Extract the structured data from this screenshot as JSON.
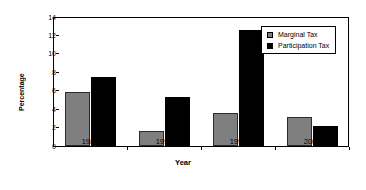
{
  "chart_data": {
    "type": "bar",
    "title": "",
    "xlabel": "Year",
    "ylabel": "Percentage",
    "categories": [
      "1986",
      "1990",
      "1993",
      "2001"
    ],
    "series": [
      {
        "name": "Marginal Tax",
        "color": "#7f7f7f",
        "values": [
          5.9,
          1.6,
          3.6,
          3.2
        ]
      },
      {
        "name": "Participation Tax",
        "color": "#000000",
        "values": [
          7.5,
          5.3,
          12.6,
          2.2
        ]
      }
    ],
    "ylim": [
      0,
      14
    ],
    "yticks": [
      "0",
      "2",
      "4",
      "6",
      "8",
      "10",
      "12",
      "14"
    ],
    "ytick_values": [
      0,
      2,
      4,
      6,
      8,
      10,
      12,
      14
    ],
    "grid": false,
    "legend_position": "top-right"
  },
  "legend": {
    "items": [
      {
        "label": "Marginal Tax"
      },
      {
        "label": "Participation Tax"
      }
    ]
  }
}
